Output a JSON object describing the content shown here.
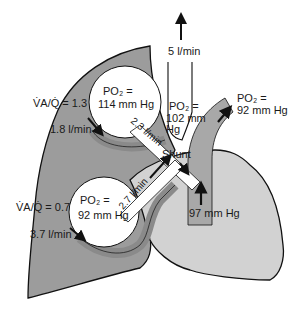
{
  "colors": {
    "lung": "#9c9c9c",
    "heart": "#d2d2d2",
    "vessel": "#a8a8a8",
    "alveolus": "#ffffff",
    "outline": "#111111"
  },
  "upper_region": {
    "va_q_label": "V̇A/Q̇ = 1.3",
    "flow_label": "1.8 l/min",
    "po2_label": "PO₂ =",
    "po2_value": "114 mm Hg"
  },
  "lower_region": {
    "va_q_label": "V̇A/Q̇ = 0.7",
    "flow_label": "3.7 l/min",
    "po2_label": "PO₂ =",
    "po2_value": "92 mm Hg"
  },
  "pulmonary_vein_upper_flow": "2.3 l/min",
  "pulmonary_vein_lower_flow": "2.7 l/min",
  "mixed_venous": {
    "po2_label": "PO₂ =",
    "po2_value": "102 mm",
    "po2_unit": "Hg"
  },
  "cardiac_output": "5 l/min",
  "shunt_label": "Shunt",
  "aorta": {
    "po2_label": "PO₂ =",
    "po2_value": "92 mm Hg"
  },
  "ventricle_pressure": "97 mm Hg"
}
